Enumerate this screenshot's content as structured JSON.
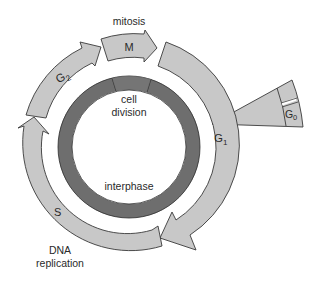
{
  "diagram": {
    "colors": {
      "band": "#c8c8c8",
      "ring": "#6e6e6e",
      "stroke": "#3a3a3a",
      "background": "#ffffff"
    },
    "labels": {
      "mitosis": "mitosis",
      "m": "M",
      "g1": "G",
      "g1_sub": "1",
      "g2": "G",
      "g2_sub": "2",
      "s": "S",
      "g0": "G",
      "g0_sub": "0",
      "cell_division_1": "cell",
      "cell_division_2": "division",
      "interphase": "interphase",
      "dna_1": "DNA",
      "dna_2": "replication"
    },
    "phases": [
      {
        "name": "M",
        "description": "mitosis"
      },
      {
        "name": "G1",
        "description": ""
      },
      {
        "name": "S",
        "description": "DNA replication"
      },
      {
        "name": "G2",
        "description": ""
      },
      {
        "name": "G0",
        "description": "resting branch off G1"
      }
    ],
    "inner_ring": [
      {
        "segment": "cell division"
      },
      {
        "segment": "interphase"
      }
    ]
  }
}
